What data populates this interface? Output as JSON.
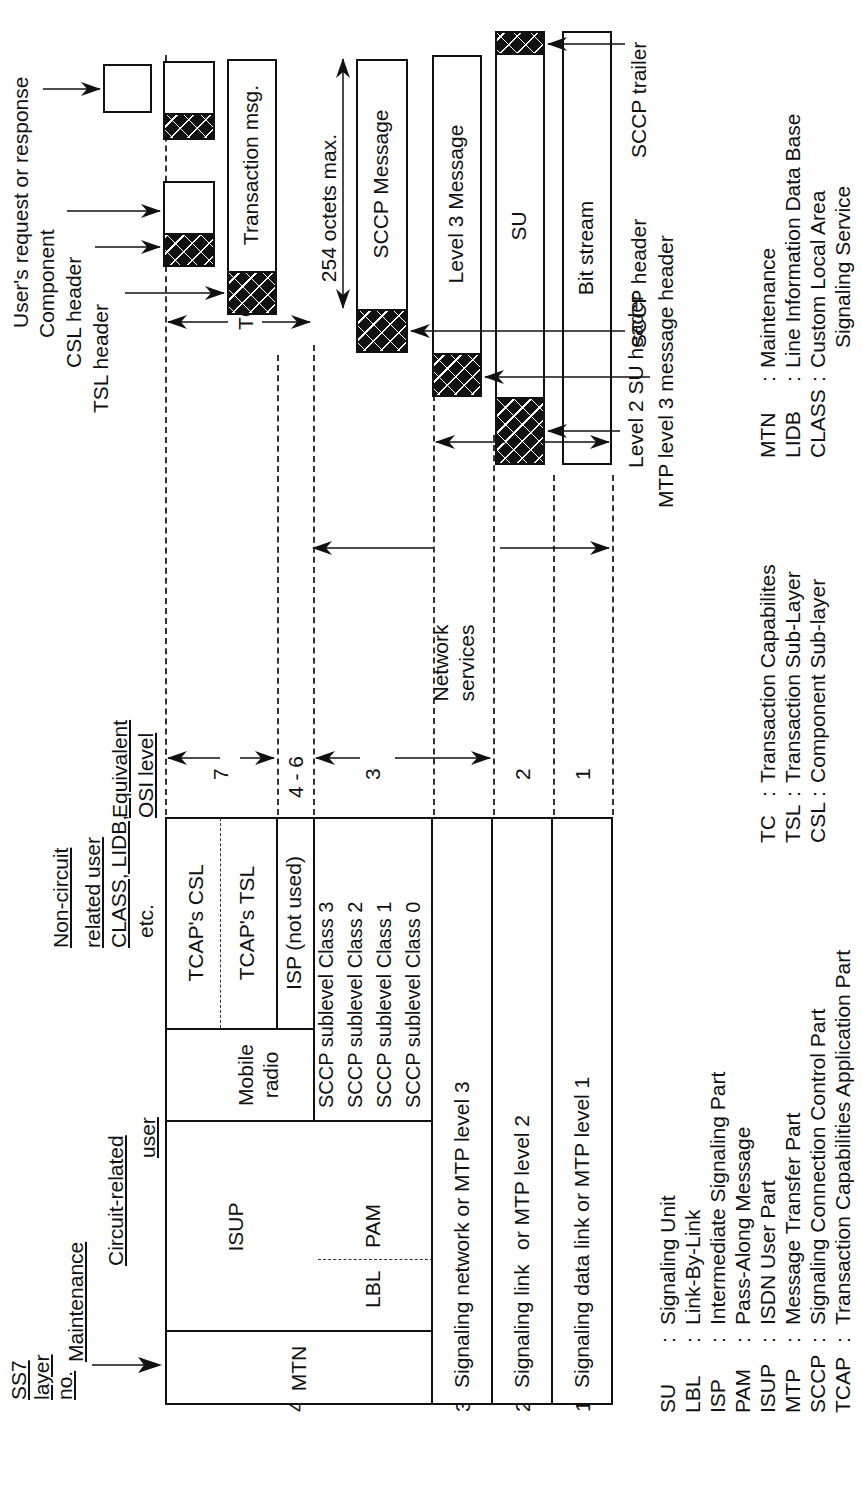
{
  "header": {
    "ss7_layer_label": [
      "SS7",
      "layer",
      "no."
    ],
    "maintenance": "Maintenance",
    "circuit_related": [
      "Circuit-related",
      "user"
    ],
    "non_circuit": [
      "Non-circuit",
      "related user",
      "CLASS, LIDB,",
      "etc."
    ],
    "osi_label": [
      "Equivalent",
      "OSI level"
    ]
  },
  "layers": [
    {
      "no": "4",
      "osi": "7"
    },
    {
      "no": "",
      "osi": "4 - 6"
    },
    {
      "no": "",
      "osi": "3"
    },
    {
      "no": "3",
      "osi": ""
    },
    {
      "no": "2",
      "osi": "2"
    },
    {
      "no": "1",
      "osi": "1"
    }
  ],
  "layer_numbers": {
    "l4": "4",
    "l3": "3",
    "l2": "2",
    "l1": "1"
  },
  "osi_levels": {
    "l7": "7",
    "l46": "4 - 6",
    "l3": "3",
    "l2": "2",
    "l1": "1"
  },
  "stack": {
    "mtn": "MTN",
    "isup": "ISUP",
    "lbl": "LBL",
    "pam": "PAM",
    "mobile_radio": [
      "Mobile",
      "radio"
    ],
    "tcap_csl": "TCAP's CSL",
    "tcap_tsl": "TCAP's TSL",
    "isp": "ISP (not used)",
    "sccp_sublevels": [
      "SCCP sublevel Class 3",
      "SCCP sublevel Class 2",
      "SCCP sublevel Class 1",
      "SCCP sublevel Class 0"
    ],
    "layer3": "Signaling network or MTP level 3",
    "layer2": [
      "Signaling link",
      "or MTP level 2"
    ],
    "layer1": "Signaling data link or MTP level 1"
  },
  "spans": {
    "tc": "TC",
    "network_services": [
      "Network",
      "services"
    ],
    "mtp": "MTP"
  },
  "messages": {
    "user_request": "User's request or response",
    "component": "Component",
    "csl_header": "CSL header",
    "tsl_header": "TSL header",
    "transaction_msg": "Transaction msg.",
    "octets": "254 octets max.",
    "sccp_message": "SCCP Message",
    "level3_message": "Level 3 Message",
    "su": "SU",
    "bit_stream": "Bit stream",
    "sccp_trailer": "SCCP trailer",
    "sccp_header": "SCCP header",
    "mtp_l3_header": "MTP level 3 message header",
    "l2_su_header": "Level 2 SU header"
  },
  "legend": {
    "col1": [
      {
        "abbr": "SU",
        "def": "Signaling Unit"
      },
      {
        "abbr": "LBL",
        "def": "Link-By-Link"
      },
      {
        "abbr": "ISP",
        "def": "Intermediate Signaling Part"
      },
      {
        "abbr": "PAM",
        "def": "Pass-Along Message"
      },
      {
        "abbr": "ISUP",
        "def": "ISDN User Part"
      },
      {
        "abbr": "MTP",
        "def": "Message Transfer Part"
      },
      {
        "abbr": "SCCP",
        "def": "Signaling Connection Control Part"
      },
      {
        "abbr": "TCAP",
        "def": "Transaction Capabilities Application Part"
      }
    ],
    "col2": [
      {
        "abbr": "TC",
        "def": "Transaction Capabilites"
      },
      {
        "abbr": "TSL",
        "def": "Transaction Sub-Layer"
      },
      {
        "abbr": "CSL",
        "def": "Component Sub-layer"
      }
    ],
    "col3": [
      {
        "abbr": "MTN",
        "def": "Maintenance"
      },
      {
        "abbr": "LIDB",
        "def": "Line Information Data Base"
      },
      {
        "abbr": "CLASS",
        "def": "Custom Local Area"
      },
      {
        "abbr": "",
        "def": "Signaling Service"
      }
    ]
  }
}
